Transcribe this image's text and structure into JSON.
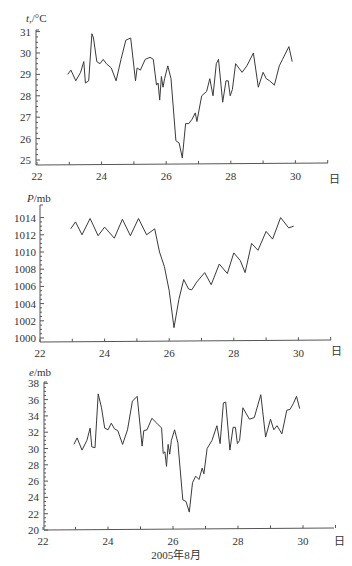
{
  "chart_data": [
    {
      "type": "line",
      "title": "",
      "ylabel": "t,/°C",
      "xlabel": "",
      "x_unit_label": "日",
      "xlim": [
        22,
        31
      ],
      "ylim": [
        24.8,
        31
      ],
      "xticks": [
        22,
        24,
        26,
        28,
        30
      ],
      "yticks": [
        25,
        26,
        27,
        28,
        29,
        30,
        31
      ],
      "grid": false,
      "series": [
        {
          "name": "temperature",
          "x": [
            22.95,
            23.05,
            23.2,
            23.35,
            23.45,
            23.5,
            23.6,
            23.7,
            23.75,
            23.85,
            23.95,
            24.05,
            24.15,
            24.3,
            24.45,
            24.6,
            24.75,
            24.9,
            25.05,
            25.1,
            25.2,
            25.35,
            25.5,
            25.6,
            25.7,
            25.75,
            25.8,
            25.85,
            25.9,
            25.95,
            26.05,
            26.15,
            26.3,
            26.4,
            26.5,
            26.6,
            26.7,
            26.8,
            26.9,
            26.95,
            27.1,
            27.25,
            27.35,
            27.45,
            27.55,
            27.62,
            27.75,
            27.85,
            27.92,
            27.98,
            28.05,
            28.15,
            28.35,
            28.5,
            28.7,
            28.85,
            29.0,
            29.1,
            29.2,
            29.35,
            29.5,
            29.6,
            29.7,
            29.8,
            29.9
          ],
          "values": [
            29.0,
            29.2,
            28.7,
            29.1,
            29.6,
            28.6,
            28.7,
            30.9,
            30.7,
            29.6,
            29.5,
            29.7,
            29.5,
            29.3,
            28.7,
            29.7,
            30.6,
            30.7,
            28.7,
            29.3,
            29.2,
            29.7,
            29.8,
            29.7,
            28.5,
            28.6,
            27.8,
            28.9,
            28.4,
            28.8,
            29.4,
            28.8,
            25.9,
            25.8,
            25.1,
            26.7,
            26.7,
            26.9,
            27.2,
            26.8,
            28.0,
            28.2,
            28.8,
            28.0,
            29.5,
            29.7,
            27.7,
            28.7,
            28.7,
            28.0,
            28.3,
            29.5,
            29.1,
            29.4,
            30.0,
            28.4,
            29.1,
            28.8,
            28.7,
            28.5,
            29.4,
            29.7,
            30.0,
            30.3,
            29.6
          ]
        }
      ]
    },
    {
      "type": "line",
      "title": "",
      "ylabel": "P/mb",
      "xlabel": "",
      "x_unit_label": "日",
      "xlim": [
        22,
        31
      ],
      "ylim": [
        999.5,
        1015
      ],
      "xticks": [
        22,
        24,
        26,
        28,
        30
      ],
      "yticks": [
        1000,
        1002,
        1004,
        1006,
        1008,
        1010,
        1012,
        1014
      ],
      "grid": false,
      "series": [
        {
          "name": "pressure",
          "x": [
            22.95,
            23.1,
            23.3,
            23.55,
            23.8,
            24.0,
            24.3,
            24.55,
            24.8,
            25.05,
            25.3,
            25.55,
            25.7,
            25.85,
            26.0,
            26.15,
            26.3,
            26.45,
            26.6,
            26.7,
            26.85,
            27.1,
            27.3,
            27.55,
            27.8,
            28.0,
            28.2,
            28.35,
            28.55,
            28.75,
            29.0,
            29.2,
            29.45,
            29.7,
            29.85
          ],
          "values": [
            1012.7,
            1013.5,
            1012.0,
            1013.9,
            1011.9,
            1012.9,
            1011.6,
            1013.8,
            1011.9,
            1013.9,
            1012.0,
            1012.7,
            1010.0,
            1008.3,
            1005.5,
            1001.2,
            1004.5,
            1006.8,
            1005.7,
            1005.6,
            1006.5,
            1007.6,
            1006.2,
            1008.6,
            1007.5,
            1009.9,
            1009.0,
            1007.6,
            1011.0,
            1010.2,
            1012.4,
            1011.5,
            1014.0,
            1012.8,
            1013.0
          ]
        }
      ]
    },
    {
      "type": "line",
      "title": "",
      "ylabel": "e/mb",
      "xlabel": "2005年8月",
      "x_unit_label": "日",
      "xlim": [
        22,
        31
      ],
      "ylim": [
        20,
        38
      ],
      "xticks": [
        22,
        24,
        26,
        28,
        30
      ],
      "yticks": [
        20,
        22,
        24,
        26,
        28,
        30,
        32,
        34,
        36,
        38
      ],
      "grid": false,
      "series": [
        {
          "name": "vapor pressure",
          "x": [
            22.95,
            23.05,
            23.2,
            23.35,
            23.45,
            23.5,
            23.6,
            23.7,
            23.8,
            23.9,
            24.0,
            24.1,
            24.2,
            24.3,
            24.45,
            24.6,
            24.75,
            24.9,
            25.05,
            25.1,
            25.2,
            25.35,
            25.5,
            25.65,
            25.7,
            25.75,
            25.8,
            25.85,
            25.9,
            25.95,
            26.05,
            26.15,
            26.3,
            26.4,
            26.5,
            26.6,
            26.7,
            26.8,
            26.9,
            26.95,
            27.05,
            27.2,
            27.35,
            27.45,
            27.55,
            27.62,
            27.75,
            27.85,
            27.92,
            27.98,
            28.05,
            28.15,
            28.35,
            28.5,
            28.7,
            28.85,
            29.0,
            29.1,
            29.2,
            29.35,
            29.5,
            29.6,
            29.7,
            29.8,
            29.9
          ],
          "values": [
            30.5,
            31.3,
            29.8,
            31.0,
            32.5,
            30.2,
            30.1,
            36.7,
            35.0,
            32.5,
            32.3,
            33.1,
            32.4,
            32.2,
            30.5,
            32.3,
            35.8,
            36.4,
            30.3,
            32.2,
            32.3,
            33.7,
            33.1,
            32.5,
            29.4,
            29.6,
            27.8,
            30.5,
            29.3,
            31.0,
            32.3,
            30.7,
            23.7,
            23.5,
            22.2,
            25.8,
            26.6,
            26.2,
            27.6,
            26.9,
            30.0,
            31.0,
            32.8,
            30.6,
            35.6,
            35.7,
            29.8,
            32.6,
            32.6,
            30.6,
            31.0,
            35.0,
            33.6,
            33.8,
            36.6,
            31.4,
            33.6,
            32.3,
            32.8,
            31.8,
            34.7,
            34.8,
            35.5,
            36.4,
            34.9
          ]
        }
      ]
    }
  ],
  "panels": {
    "temperature": {
      "ylabel_italic": "t",
      "ylabel_rest": ",/°C",
      "x_unit": "日"
    },
    "pressure": {
      "ylabel_italic": "P",
      "ylabel_rest": "/mb",
      "x_unit": "日"
    },
    "vapor": {
      "ylabel_italic": "e",
      "ylabel_rest": "/mb",
      "x_unit": "日",
      "xlabel": "2005年8月"
    }
  }
}
